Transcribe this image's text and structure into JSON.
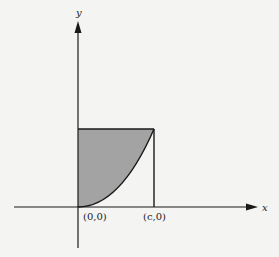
{
  "figure": {
    "axes": {
      "x_label": "x",
      "y_label": "y"
    },
    "points": [
      {
        "label": "(0,0)"
      },
      {
        "label": "(c,0)"
      }
    ],
    "colors": {
      "shade": "#a3a3a3",
      "stroke": "#1a1a1a",
      "background": "#f4f4f2"
    }
  }
}
